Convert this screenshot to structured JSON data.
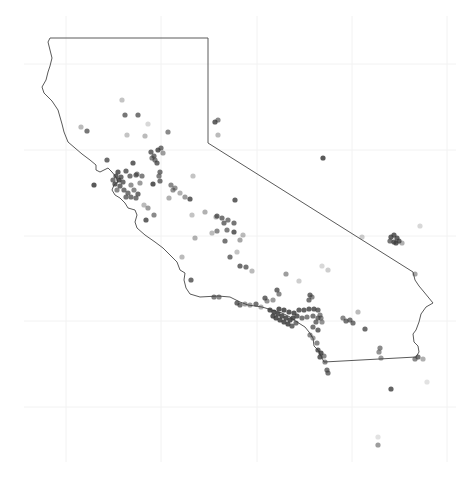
{
  "map": {
    "title": "",
    "region": "California",
    "colors": {
      "background": "#ffffff",
      "grid": "#f2f2f2",
      "border": "#5a5a5a",
      "point": "#3c3c3c"
    },
    "grid": {
      "x": [
        66,
        161,
        257,
        352,
        447
      ],
      "y": [
        64,
        150,
        236,
        321,
        407
      ],
      "x_extent": [
        24,
        456
      ],
      "y_extent": [
        16,
        462
      ]
    },
    "border_path": "M50,38 L208,38 L208,143 L413,272 L415,280 L419,286 L424,292 L433,303 L426,307 L421,314 L419,322 L416,330 L413,334 L414,342 L418,346 L419,352 L416,357 L324,362 L321,356 L318,350 L314,346 L313,338 L309,332 L305,327 L297,322 L290,317 L282,313 L272,310 L262,307 L248,305 L240,302 L230,297 L218,296 L200,297 L190,294 L186,288 L184,280 L185,273 L180,270 L177,262 L170,255 L163,248 L155,242 L145,235 L137,228 L135,222 L137,215 L135,210 L128,208 L125,203 L120,198 L115,195 L112,190 L114,185 L118,182 L116,177 L112,172 L108,168 L100,172 L96,170 L96,165 L90,160 L82,154 L75,148 L68,142 L64,132 L62,124 L58,110 L52,101 L44,93 L42,87 L46,80 L48,72 L50,66 L52,58 L50,50 L48,42 Z",
    "points": [
      {
        "x": 122,
        "y": 100,
        "o": 0.3
      },
      {
        "x": 125,
        "y": 115,
        "o": 0.7
      },
      {
        "x": 138,
        "y": 115,
        "o": 0.7
      },
      {
        "x": 81,
        "y": 127,
        "o": 0.35
      },
      {
        "x": 87,
        "y": 131,
        "o": 0.7
      },
      {
        "x": 127,
        "y": 135,
        "o": 0.3
      },
      {
        "x": 145,
        "y": 136,
        "o": 0.35
      },
      {
        "x": 168,
        "y": 132,
        "o": 0.6
      },
      {
        "x": 148,
        "y": 124,
        "o": 0.2
      },
      {
        "x": 107,
        "y": 160,
        "o": 0.75
      },
      {
        "x": 94,
        "y": 185,
        "o": 0.85
      },
      {
        "x": 133,
        "y": 163,
        "o": 0.8
      },
      {
        "x": 137,
        "y": 174,
        "o": 0.6
      },
      {
        "x": 153,
        "y": 184,
        "o": 0.85
      },
      {
        "x": 160,
        "y": 181,
        "o": 0.7
      },
      {
        "x": 171,
        "y": 185,
        "o": 0.6
      },
      {
        "x": 173,
        "y": 190,
        "o": 0.55
      },
      {
        "x": 190,
        "y": 199,
        "o": 0.8
      },
      {
        "x": 151,
        "y": 152,
        "o": 0.75
      },
      {
        "x": 154,
        "y": 156,
        "o": 0.7
      },
      {
        "x": 158,
        "y": 150,
        "o": 0.8
      },
      {
        "x": 161,
        "y": 148,
        "o": 0.7
      },
      {
        "x": 155,
        "y": 160,
        "o": 0.65
      },
      {
        "x": 157,
        "y": 163,
        "o": 0.75
      },
      {
        "x": 152,
        "y": 158,
        "o": 0.6
      },
      {
        "x": 163,
        "y": 153,
        "o": 0.5
      },
      {
        "x": 160,
        "y": 172,
        "o": 0.7
      },
      {
        "x": 159,
        "y": 176,
        "o": 0.65
      },
      {
        "x": 126,
        "y": 171,
        "o": 0.75
      },
      {
        "x": 130,
        "y": 176,
        "o": 0.7
      },
      {
        "x": 136,
        "y": 175,
        "o": 0.7
      },
      {
        "x": 142,
        "y": 176,
        "o": 0.65
      },
      {
        "x": 140,
        "y": 183,
        "o": 0.5
      },
      {
        "x": 131,
        "y": 185,
        "o": 0.55
      },
      {
        "x": 118,
        "y": 172,
        "o": 0.8
      },
      {
        "x": 116,
        "y": 176,
        "o": 0.8
      },
      {
        "x": 119,
        "y": 180,
        "o": 0.85
      },
      {
        "x": 115,
        "y": 184,
        "o": 0.8
      },
      {
        "x": 120,
        "y": 186,
        "o": 0.75
      },
      {
        "x": 123,
        "y": 182,
        "o": 0.75
      },
      {
        "x": 124,
        "y": 190,
        "o": 0.7
      },
      {
        "x": 128,
        "y": 193,
        "o": 0.7
      },
      {
        "x": 131,
        "y": 197,
        "o": 0.7
      },
      {
        "x": 126,
        "y": 197,
        "o": 0.7
      },
      {
        "x": 136,
        "y": 198,
        "o": 0.7
      },
      {
        "x": 138,
        "y": 194,
        "o": 0.75
      },
      {
        "x": 134,
        "y": 190,
        "o": 0.6
      },
      {
        "x": 121,
        "y": 177,
        "o": 0.75
      },
      {
        "x": 117,
        "y": 190,
        "o": 0.6
      },
      {
        "x": 113,
        "y": 180,
        "o": 0.7
      },
      {
        "x": 146,
        "y": 220,
        "o": 0.8
      },
      {
        "x": 154,
        "y": 215,
        "o": 0.6
      },
      {
        "x": 148,
        "y": 208,
        "o": 0.5
      },
      {
        "x": 144,
        "y": 205,
        "o": 0.35
      },
      {
        "x": 175,
        "y": 188,
        "o": 0.55
      },
      {
        "x": 180,
        "y": 193,
        "o": 0.4
      },
      {
        "x": 185,
        "y": 197,
        "o": 0.5
      },
      {
        "x": 169,
        "y": 198,
        "o": 0.4
      },
      {
        "x": 193,
        "y": 176,
        "o": 0.3
      },
      {
        "x": 205,
        "y": 212,
        "o": 0.4
      },
      {
        "x": 192,
        "y": 215,
        "o": 0.3
      },
      {
        "x": 235,
        "y": 200,
        "o": 0.8
      },
      {
        "x": 216,
        "y": 217,
        "o": 0.35
      },
      {
        "x": 217,
        "y": 216,
        "o": 0.75
      },
      {
        "x": 222,
        "y": 218,
        "o": 0.7
      },
      {
        "x": 224,
        "y": 223,
        "o": 0.7
      },
      {
        "x": 228,
        "y": 220,
        "o": 0.65
      },
      {
        "x": 234,
        "y": 223,
        "o": 0.7
      },
      {
        "x": 227,
        "y": 230,
        "o": 0.65
      },
      {
        "x": 234,
        "y": 232,
        "o": 0.8
      },
      {
        "x": 217,
        "y": 231,
        "o": 0.6
      },
      {
        "x": 212,
        "y": 233,
        "o": 0.35
      },
      {
        "x": 195,
        "y": 238,
        "o": 0.4
      },
      {
        "x": 225,
        "y": 241,
        "o": 0.7
      },
      {
        "x": 240,
        "y": 240,
        "o": 0.45
      },
      {
        "x": 243,
        "y": 235,
        "o": 0.35
      },
      {
        "x": 237,
        "y": 252,
        "o": 0.3
      },
      {
        "x": 182,
        "y": 257,
        "o": 0.35
      },
      {
        "x": 230,
        "y": 257,
        "o": 0.7
      },
      {
        "x": 240,
        "y": 266,
        "o": 0.75
      },
      {
        "x": 246,
        "y": 267,
        "o": 0.7
      },
      {
        "x": 252,
        "y": 271,
        "o": 0.35
      },
      {
        "x": 191,
        "y": 280,
        "o": 0.75
      },
      {
        "x": 215,
        "y": 122,
        "o": 0.8
      },
      {
        "x": 218,
        "y": 120,
        "o": 0.6
      },
      {
        "x": 218,
        "y": 135,
        "o": 0.35
      },
      {
        "x": 323,
        "y": 158,
        "o": 0.85
      },
      {
        "x": 391,
        "y": 237,
        "o": 0.8
      },
      {
        "x": 394,
        "y": 235,
        "o": 0.8
      },
      {
        "x": 397,
        "y": 238,
        "o": 0.8
      },
      {
        "x": 399,
        "y": 241,
        "o": 0.8
      },
      {
        "x": 394,
        "y": 242,
        "o": 0.8
      },
      {
        "x": 390,
        "y": 241,
        "o": 0.7
      },
      {
        "x": 396,
        "y": 243,
        "o": 0.8
      },
      {
        "x": 402,
        "y": 243,
        "o": 0.4
      },
      {
        "x": 362,
        "y": 237,
        "o": 0.25
      },
      {
        "x": 420,
        "y": 226,
        "o": 0.2
      },
      {
        "x": 415,
        "y": 274,
        "o": 0.45
      },
      {
        "x": 286,
        "y": 274,
        "o": 0.5
      },
      {
        "x": 277,
        "y": 290,
        "o": 0.75
      },
      {
        "x": 279,
        "y": 294,
        "o": 0.6
      },
      {
        "x": 273,
        "y": 300,
        "o": 0.5
      },
      {
        "x": 310,
        "y": 295,
        "o": 0.75
      },
      {
        "x": 309,
        "y": 300,
        "o": 0.7
      },
      {
        "x": 312,
        "y": 297,
        "o": 0.6
      },
      {
        "x": 299,
        "y": 281,
        "o": 0.25
      },
      {
        "x": 328,
        "y": 270,
        "o": 0.25
      },
      {
        "x": 322,
        "y": 266,
        "o": 0.2
      },
      {
        "x": 214,
        "y": 297,
        "o": 0.65
      },
      {
        "x": 219,
        "y": 297,
        "o": 0.6
      },
      {
        "x": 237,
        "y": 303,
        "o": 0.75
      },
      {
        "x": 240,
        "y": 305,
        "o": 0.7
      },
      {
        "x": 245,
        "y": 304,
        "o": 0.5
      },
      {
        "x": 250,
        "y": 305,
        "o": 0.5
      },
      {
        "x": 256,
        "y": 304,
        "o": 0.7
      },
      {
        "x": 265,
        "y": 298,
        "o": 0.75
      },
      {
        "x": 267,
        "y": 301,
        "o": 0.55
      },
      {
        "x": 261,
        "y": 307,
        "o": 0.4
      },
      {
        "x": 270,
        "y": 310,
        "o": 0.85
      },
      {
        "x": 274,
        "y": 312,
        "o": 0.85
      },
      {
        "x": 278,
        "y": 314,
        "o": 0.85
      },
      {
        "x": 282,
        "y": 316,
        "o": 0.85
      },
      {
        "x": 286,
        "y": 318,
        "o": 0.85
      },
      {
        "x": 290,
        "y": 320,
        "o": 0.85
      },
      {
        "x": 276,
        "y": 318,
        "o": 0.85
      },
      {
        "x": 280,
        "y": 320,
        "o": 0.85
      },
      {
        "x": 284,
        "y": 322,
        "o": 0.85
      },
      {
        "x": 288,
        "y": 324,
        "o": 0.85
      },
      {
        "x": 273,
        "y": 316,
        "o": 0.85
      },
      {
        "x": 279,
        "y": 309,
        "o": 0.85
      },
      {
        "x": 284,
        "y": 310,
        "o": 0.85
      },
      {
        "x": 289,
        "y": 312,
        "o": 0.85
      },
      {
        "x": 294,
        "y": 313,
        "o": 0.85
      },
      {
        "x": 299,
        "y": 310,
        "o": 0.8
      },
      {
        "x": 304,
        "y": 310,
        "o": 0.8
      },
      {
        "x": 309,
        "y": 309,
        "o": 0.8
      },
      {
        "x": 314,
        "y": 309,
        "o": 0.8
      },
      {
        "x": 318,
        "y": 310,
        "o": 0.75
      },
      {
        "x": 293,
        "y": 318,
        "o": 0.85
      },
      {
        "x": 297,
        "y": 316,
        "o": 0.8
      },
      {
        "x": 292,
        "y": 326,
        "o": 0.75
      },
      {
        "x": 296,
        "y": 323,
        "o": 0.7
      },
      {
        "x": 302,
        "y": 318,
        "o": 0.7
      },
      {
        "x": 307,
        "y": 317,
        "o": 0.65
      },
      {
        "x": 313,
        "y": 316,
        "o": 0.7
      },
      {
        "x": 318,
        "y": 318,
        "o": 0.7
      },
      {
        "x": 316,
        "y": 322,
        "o": 0.7
      },
      {
        "x": 320,
        "y": 315,
        "o": 0.6
      },
      {
        "x": 322,
        "y": 322,
        "o": 0.55
      },
      {
        "x": 313,
        "y": 327,
        "o": 0.7
      },
      {
        "x": 318,
        "y": 330,
        "o": 0.75
      },
      {
        "x": 321,
        "y": 318,
        "o": 0.6
      },
      {
        "x": 310,
        "y": 335,
        "o": 0.6
      },
      {
        "x": 313,
        "y": 338,
        "o": 0.5
      },
      {
        "x": 317,
        "y": 343,
        "o": 0.6
      },
      {
        "x": 318,
        "y": 350,
        "o": 0.8
      },
      {
        "x": 321,
        "y": 353,
        "o": 0.85
      },
      {
        "x": 320,
        "y": 357,
        "o": 0.8
      },
      {
        "x": 324,
        "y": 356,
        "o": 0.6
      },
      {
        "x": 325,
        "y": 362,
        "o": 0.6
      },
      {
        "x": 327,
        "y": 370,
        "o": 0.7
      },
      {
        "x": 328,
        "y": 373,
        "o": 0.7
      },
      {
        "x": 343,
        "y": 318,
        "o": 0.6
      },
      {
        "x": 346,
        "y": 321,
        "o": 0.7
      },
      {
        "x": 350,
        "y": 320,
        "o": 0.7
      },
      {
        "x": 353,
        "y": 323,
        "o": 0.7
      },
      {
        "x": 358,
        "y": 312,
        "o": 0.35
      },
      {
        "x": 365,
        "y": 329,
        "o": 0.75
      },
      {
        "x": 380,
        "y": 348,
        "o": 0.6
      },
      {
        "x": 379,
        "y": 352,
        "o": 0.55
      },
      {
        "x": 381,
        "y": 358,
        "o": 0.5
      },
      {
        "x": 415,
        "y": 359,
        "o": 0.6
      },
      {
        "x": 418,
        "y": 357,
        "o": 0.7
      },
      {
        "x": 423,
        "y": 359,
        "o": 0.4
      },
      {
        "x": 391,
        "y": 389,
        "o": 0.8
      },
      {
        "x": 378,
        "y": 445,
        "o": 0.5
      },
      {
        "x": 378,
        "y": 437,
        "o": 0.15
      },
      {
        "x": 427,
        "y": 382,
        "o": 0.15
      }
    ]
  }
}
